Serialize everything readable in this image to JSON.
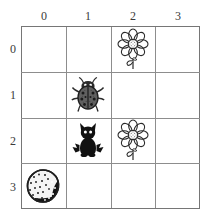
{
  "worksheet": {
    "type": "coordinate-grid",
    "columns": 4,
    "rows": 4,
    "background_color": "#ffffff",
    "grid_line_color": "#8d8d8d",
    "label_color": "#3a3a3a"
  },
  "column_headers": [
    {
      "label": "0",
      "index": 0
    },
    {
      "label": "1",
      "index": 1
    },
    {
      "label": "2",
      "index": 2
    },
    {
      "label": "3",
      "index": 3
    }
  ],
  "row_headers": [
    {
      "label": "0",
      "index": 0
    },
    {
      "label": "1",
      "index": 1
    },
    {
      "label": "2",
      "index": 2
    },
    {
      "label": "3",
      "index": 3
    }
  ],
  "items": [
    {
      "icon": "flower-icon",
      "name": "flower",
      "row": 0,
      "column": 2,
      "colors": {
        "outline": "#2b2b2b",
        "center": "#9a9a9a"
      }
    },
    {
      "icon": "ladybug-icon",
      "name": "ladybug",
      "row": 1,
      "column": 1,
      "colors": {
        "body": "#2b2b2b",
        "shell": "#585858"
      }
    },
    {
      "icon": "cat-icon",
      "name": "cat",
      "row": 2,
      "column": 1,
      "colors": {
        "body": "#111111"
      }
    },
    {
      "icon": "flower-icon",
      "name": "flower",
      "row": 2,
      "column": 2,
      "colors": {
        "outline": "#2b2b2b",
        "center": "#9a9a9a"
      }
    },
    {
      "icon": "rock-icon",
      "name": "rock",
      "row": 3,
      "column": 0,
      "colors": {
        "light": "#f2f2f2",
        "dark": "#1a1a1a",
        "outline": "#2b2b2b"
      }
    }
  ]
}
